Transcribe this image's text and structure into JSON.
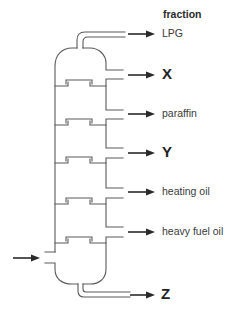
{
  "diagram": {
    "header": "fraction",
    "inlet": {
      "name": "feed-inlet"
    },
    "outlets": [
      {
        "id": "lpg",
        "label": "LPG",
        "unknown": false
      },
      {
        "id": "x",
        "label": "X",
        "unknown": true
      },
      {
        "id": "paraffin",
        "label": "paraffin",
        "unknown": false
      },
      {
        "id": "y",
        "label": "Y",
        "unknown": true
      },
      {
        "id": "heating-oil",
        "label": "heating oil",
        "unknown": false
      },
      {
        "id": "heavy-fuel-oil",
        "label": "heavy fuel oil",
        "unknown": false
      },
      {
        "id": "z",
        "label": "Z",
        "unknown": true
      }
    ],
    "tray_count": 5
  },
  "colors": {
    "column_stroke": "#5a5a5a",
    "arrow": "#2a2a2a",
    "label_text": "#3a3a3a",
    "background": "#ffffff"
  }
}
